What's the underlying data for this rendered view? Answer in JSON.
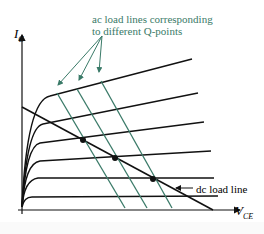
{
  "labels": {
    "y_axis": "I",
    "y_axis_sub": "C",
    "x_axis": "V",
    "x_axis_sub": "CE",
    "annotation_line1": "ac load lines corresponding",
    "annotation_line2": "to different Q-points",
    "dc_load_line": "dc load line"
  },
  "colors": {
    "curves": "#111111",
    "ac_lines": "#3a7a68",
    "text": "#222222"
  }
}
